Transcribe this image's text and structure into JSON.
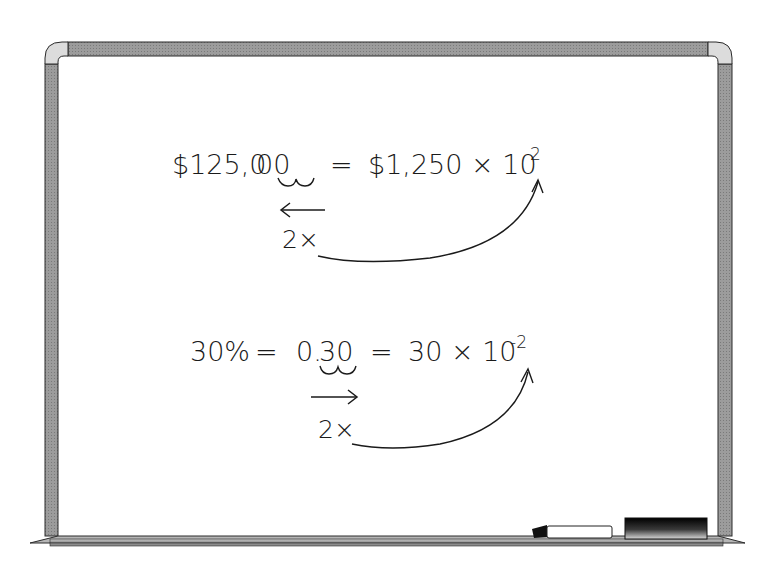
{
  "scene": {
    "object": "whiteboard",
    "colors": {
      "frame": "#9a9a9a",
      "frame_corner": "#d9d9d9",
      "frame_outline": "#2a2a2a",
      "board": "#ffffff",
      "ink": "#1a1a1a",
      "eraser_dark": "#111111"
    }
  },
  "equation1": {
    "lhs": "$125,000",
    "lhs_prefix": "$125,0",
    "lhs_underlined": "00",
    "equals": "=",
    "rhs_base": "$1,250 × 10",
    "rhs_exponent": "2",
    "shift_label": "2×",
    "shift_direction": "left"
  },
  "equation2": {
    "lhs": "30%",
    "equals1": "=",
    "mid_prefix": "0.",
    "mid_underlined": "30",
    "equals2": "=",
    "rhs_base": "30 × 10",
    "rhs_exponent": "-2",
    "shift_label": "2×",
    "shift_direction": "right"
  },
  "tray_items": [
    {
      "name": "marker"
    },
    {
      "name": "eraser"
    }
  ]
}
